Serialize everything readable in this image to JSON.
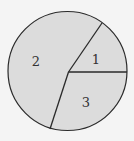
{
  "diagram": {
    "type": "circle-partition",
    "fill_color": "#dcdcdc",
    "stroke_color": "#2a2a2a",
    "regions": [
      {
        "label": "1"
      },
      {
        "label": "2"
      },
      {
        "label": "3"
      }
    ]
  }
}
